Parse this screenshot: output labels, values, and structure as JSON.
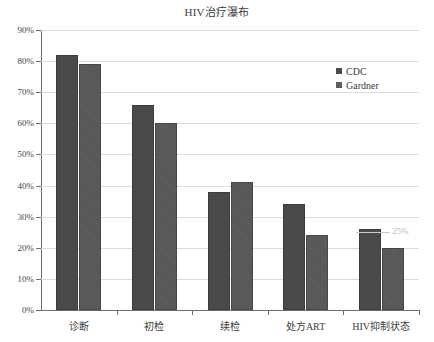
{
  "chart_data": {
    "type": "bar",
    "title": "HIV治疗瀑布",
    "xlabel": "",
    "ylabel": "",
    "ylim": [
      0,
      90
    ],
    "grid": true,
    "legend_position": "top-right",
    "categories": [
      "诊断",
      "初检",
      "续检",
      "处方ART",
      "HIV抑制状态"
    ],
    "series": [
      {
        "name": "CDC",
        "values": [
          82,
          66,
          38,
          34,
          26
        ],
        "color": "#4a4a4a"
      },
      {
        "name": "Gardner",
        "values": [
          79,
          60,
          41,
          24,
          20
        ],
        "color": "#5d5d5d"
      }
    ],
    "ytick_labels": [
      "90%",
      "80%",
      "70%",
      "60%",
      "50%",
      "40%",
      "30%",
      "20%",
      "10%",
      "0%"
    ],
    "ytick_values": [
      90,
      80,
      70,
      60,
      50,
      40,
      30,
      20,
      10,
      0
    ],
    "annotations": [
      {
        "text": "25%",
        "value": 25,
        "color": "#b9b9b9"
      }
    ]
  },
  "legend": {
    "entries": [
      {
        "label": "CDC"
      },
      {
        "label": "Gardner"
      }
    ]
  }
}
